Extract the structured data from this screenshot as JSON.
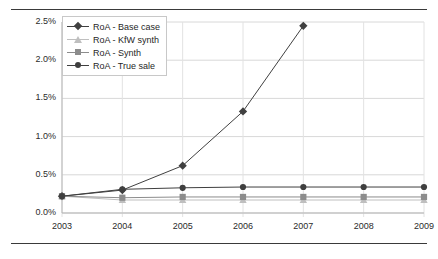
{
  "chart_data": {
    "type": "line",
    "title": "",
    "xlabel": "",
    "ylabel": "",
    "x": [
      "2003",
      "2004",
      "2005",
      "2006",
      "2007",
      "2008",
      "2009"
    ],
    "ylim": [
      0.0,
      2.5
    ],
    "ytick_labels": [
      "0.0%",
      "0.5%",
      "1.0%",
      "1.5%",
      "2.0%",
      "2.5%"
    ],
    "ytick_values": [
      0.0,
      0.5,
      1.0,
      1.5,
      2.0,
      2.5
    ],
    "grid": true,
    "legend_position": "upper-left",
    "series": [
      {
        "name": "RoA - Base case",
        "marker": "diamond",
        "color": "#404040",
        "values": [
          0.22,
          0.3,
          0.62,
          1.33,
          2.45,
          null,
          null
        ]
      },
      {
        "name": "RoA - KfW synth",
        "marker": "triangle",
        "color": "#bfbfbf",
        "values": [
          0.22,
          0.17,
          0.17,
          0.17,
          0.17,
          0.17,
          0.17
        ]
      },
      {
        "name": "RoA - Synth",
        "marker": "square",
        "color": "#8c8c8c",
        "values": [
          0.22,
          0.2,
          0.21,
          0.21,
          0.21,
          0.21,
          0.21
        ]
      },
      {
        "name": "RoA - True sale",
        "marker": "circle",
        "color": "#3f3f3f",
        "values": [
          0.22,
          0.31,
          0.33,
          0.34,
          0.34,
          0.34,
          0.34
        ]
      }
    ]
  }
}
